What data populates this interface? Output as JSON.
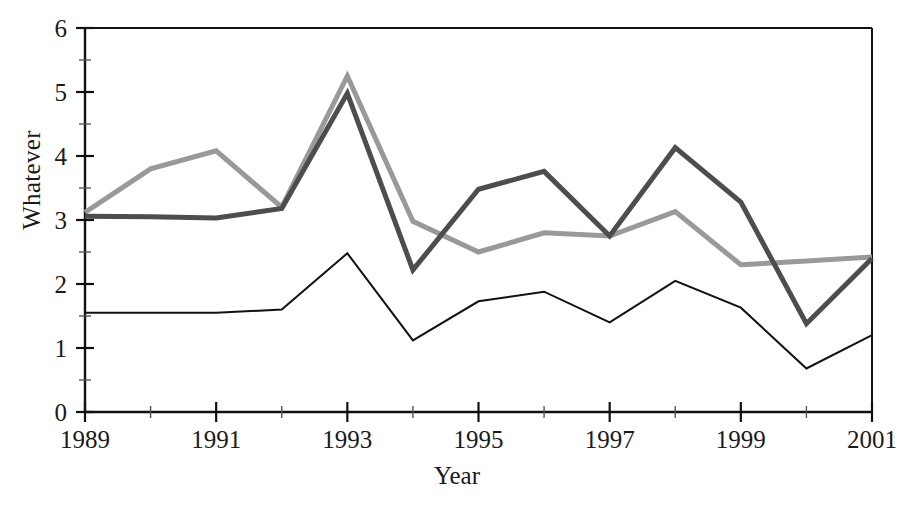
{
  "chart_data": {
    "type": "line",
    "title": "",
    "xlabel": "Year",
    "ylabel": "Whatever",
    "xlim": [
      1989,
      2001
    ],
    "ylim": [
      0,
      6
    ],
    "grid": false,
    "legend": "none",
    "x": [
      1989,
      1990,
      1991,
      1992,
      1993,
      1994,
      1995,
      1996,
      1997,
      1998,
      1999,
      2000,
      2001
    ],
    "x_tick_labels": [
      "1989",
      "1991",
      "1993",
      "1995",
      "1997",
      "1999",
      "2001"
    ],
    "x_tick_values": [
      1989,
      1991,
      1993,
      1995,
      1997,
      1999,
      2001
    ],
    "x_minor_ticks": [
      1990,
      1992,
      1994,
      1996,
      1998,
      2000
    ],
    "y_tick_labels": [
      "0",
      "1",
      "2",
      "3",
      "4",
      "5",
      "6"
    ],
    "y_tick_values": [
      0,
      1,
      2,
      3,
      4,
      5,
      6
    ],
    "y_minor_ticks": [
      0.5,
      1.5,
      2.5,
      3.5,
      4.5,
      5.5
    ],
    "series": [
      {
        "name": "light-gray-series",
        "color": "#999999",
        "width": 5,
        "values": [
          3.12,
          3.8,
          4.08,
          3.2,
          5.25,
          2.98,
          2.5,
          2.8,
          2.75,
          3.13,
          2.3,
          2.36,
          2.42
        ]
      },
      {
        "name": "dark-gray-series",
        "color": "#4d4d4d",
        "width": 5,
        "values": [
          3.06,
          3.05,
          3.03,
          3.18,
          4.98,
          2.22,
          3.48,
          3.76,
          2.75,
          4.13,
          3.28,
          1.38,
          2.4
        ]
      },
      {
        "name": "black-series",
        "color": "#111111",
        "width": 2,
        "values": [
          1.55,
          1.55,
          1.55,
          1.6,
          2.48,
          1.12,
          1.73,
          1.88,
          1.4,
          2.05,
          1.63,
          0.68,
          1.2
        ]
      }
    ]
  },
  "axes": {
    "frame_color": "#111111",
    "tick_color": "#555555"
  }
}
